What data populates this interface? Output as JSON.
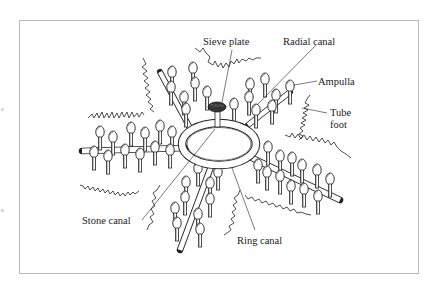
{
  "diagram": {
    "labels": {
      "sieve_plate": "Sieve plate",
      "radial_canal": "Radial canal",
      "ampulla": "Ampulla",
      "tube_foot_line1": "Tube",
      "tube_foot_line2": "foot",
      "stone_canal": "Stone canal",
      "ring_canal": "Ring canal"
    },
    "colors": {
      "ink": "#222222",
      "frame": "#b9b9b9",
      "background": "#ffffff"
    }
  }
}
